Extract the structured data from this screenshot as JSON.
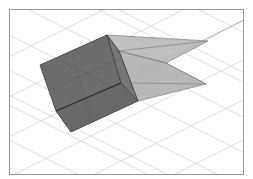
{
  "scene": {
    "description": "3D view of a cube with an attached pyramid-shaped frustum on a ground grid",
    "colors": {
      "background": "#ffffff",
      "frame": "#9a9a9a",
      "grid": "#d4d4d4",
      "cube_face": "#6e6e6e",
      "cube_edge": "#3e3e3e",
      "frustum_face": "#b4b4b4",
      "frustum_face_dark": "#a2a2a2",
      "frustum_edge": "#8a8a8a",
      "axis_line": "#b8b8b8"
    },
    "objects": [
      {
        "name": "cube",
        "type": "box"
      },
      {
        "name": "frustum",
        "type": "pyramid"
      },
      {
        "name": "ground-grid",
        "type": "grid"
      }
    ]
  }
}
